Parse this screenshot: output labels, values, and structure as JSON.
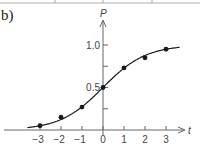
{
  "panel": {
    "label": "b)"
  },
  "chart_data": {
    "type": "line",
    "title": "",
    "xlabel": "t",
    "ylabel": "P",
    "x_ticks": [
      "−3",
      "−2",
      "−1",
      "0",
      "1",
      "2",
      "3"
    ],
    "y_ticks": [
      "0.5",
      "1.0"
    ],
    "y_minor_ticks": [
      0.25,
      0.75
    ],
    "xlim": [
      -3.6,
      3.6
    ],
    "ylim": [
      0,
      1.15
    ],
    "grid": false,
    "legend": null,
    "series": [
      {
        "name": "P(t)",
        "style": "smooth curve with markers",
        "x": [
          -3,
          -2,
          -1,
          0,
          1,
          2,
          3
        ],
        "values": [
          0.05,
          0.15,
          0.27,
          0.5,
          0.73,
          0.85,
          0.95
        ]
      }
    ]
  },
  "colors": {
    "line": "#1a1a1a",
    "axis": "#666666",
    "text": "#444444"
  }
}
